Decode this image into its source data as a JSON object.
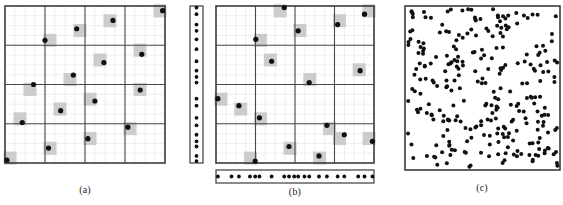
{
  "figure": {
    "title": ""
  },
  "panels": [
    {
      "id": "a",
      "caption": "(a)",
      "type": "grid-point-pattern",
      "frame": {
        "x": 5,
        "y": 6,
        "width": 160,
        "height": 157
      },
      "grid": {
        "major_cols": 4,
        "major_rows": 4,
        "minor_per_major": 4,
        "minor_color": "#e9dede",
        "major_color": "#4a4a4a"
      },
      "highlight_color": "#cccccc",
      "point_color": "#101010",
      "point_radius": 2.6,
      "highlight_size": 13,
      "points_norm": [
        [
          0.985,
          0.03
        ],
        [
          0.675,
          0.092
        ],
        [
          0.448,
          0.145
        ],
        [
          0.25,
          0.218
        ],
        [
          0.855,
          0.308
        ],
        [
          0.618,
          0.36
        ],
        [
          0.427,
          0.44
        ],
        [
          0.178,
          0.5
        ],
        [
          0.845,
          0.535
        ],
        [
          0.562,
          0.605
        ],
        [
          0.348,
          0.667
        ],
        [
          0.108,
          0.742
        ],
        [
          0.768,
          0.772
        ],
        [
          0.518,
          0.845
        ],
        [
          0.272,
          0.905
        ],
        [
          0.012,
          0.982
        ]
      ]
    },
    {
      "id": "b",
      "caption": "(b)",
      "type": "grid-point-pattern-with-margins",
      "frame": {
        "x": 216,
        "y": 6,
        "width": 158,
        "height": 157
      },
      "grid": {
        "major_cols": 4,
        "major_rows": 4,
        "minor_per_major": 4,
        "minor_color": "#e9dede",
        "major_color": "#4a4a4a"
      },
      "highlight_color": "#cccccc",
      "point_color": "#101010",
      "point_radius": 2.6,
      "highlight_size": 13,
      "points_norm": [
        [
          0.77,
          0.118
        ],
        [
          0.52,
          0.158
        ],
        [
          0.252,
          0.212
        ],
        [
          0.432,
          0.01
        ],
        [
          0.94,
          0.052
        ],
        [
          0.352,
          0.352
        ],
        [
          0.912,
          0.412
        ],
        [
          0.59,
          0.488
        ],
        [
          0.012,
          0.59
        ],
        [
          0.145,
          0.635
        ],
        [
          0.275,
          0.712
        ],
        [
          0.702,
          0.76
        ],
        [
          0.812,
          0.82
        ],
        [
          0.99,
          0.862
        ],
        [
          0.462,
          0.895
        ],
        [
          0.652,
          0.955
        ],
        [
          0.248,
          0.988
        ]
      ],
      "left_margin_strip": {
        "x": 190,
        "y": 6,
        "width": 13,
        "height": 157,
        "values_norm": [
          0.01,
          0.052,
          0.118,
          0.158,
          0.212,
          0.275,
          0.352,
          0.412,
          0.452,
          0.488,
          0.59,
          0.635,
          0.712,
          0.76,
          0.82,
          0.862,
          0.895,
          0.955,
          0.988
        ]
      },
      "bottom_margin_strip": {
        "x": 216,
        "y": 170,
        "width": 158,
        "height": 13,
        "values_norm": [
          0.012,
          0.098,
          0.145,
          0.215,
          0.248,
          0.275,
          0.352,
          0.432,
          0.462,
          0.495,
          0.52,
          0.56,
          0.59,
          0.652,
          0.702,
          0.77,
          0.812,
          0.9,
          0.94,
          0.99
        ]
      }
    },
    {
      "id": "c",
      "caption": "(c)",
      "type": "random-point-pattern",
      "frame": {
        "x": 405,
        "y": 6,
        "width": 155,
        "height": 164
      },
      "point_color": "#101010",
      "point_radius": 2.0,
      "point_count": 276,
      "seed": 20240517
    }
  ],
  "captions": {
    "a": "(a)",
    "b": "(b)",
    "c": "(c)"
  },
  "colors": {
    "background": "#ffffff",
    "frame": "#3a3a3a",
    "major_grid": "#4a4a4a",
    "minor_grid": "#e9dede",
    "highlight_cell": "#cccccc",
    "point": "#101010",
    "caption_text": "#1a1a1a"
  }
}
